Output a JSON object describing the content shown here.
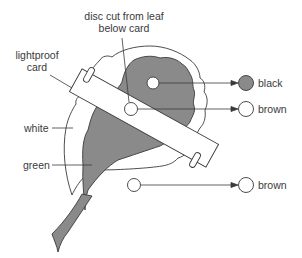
{
  "labels": {
    "disc_cut": [
      "disc cut from leaf",
      "below card"
    ],
    "lightproof_card": [
      "lightproof",
      "card"
    ],
    "white": "white",
    "green": "green"
  },
  "results": [
    {
      "label": "black",
      "disc_fill": "#8a8a8a"
    },
    {
      "label": "brown",
      "disc_fill": "#ffffff"
    },
    {
      "label": "brown",
      "disc_fill": "#ffffff"
    }
  ],
  "colors": {
    "leaf_green_area": "#8a8a8a",
    "line": "#3a3a3a",
    "background": "#ffffff"
  }
}
